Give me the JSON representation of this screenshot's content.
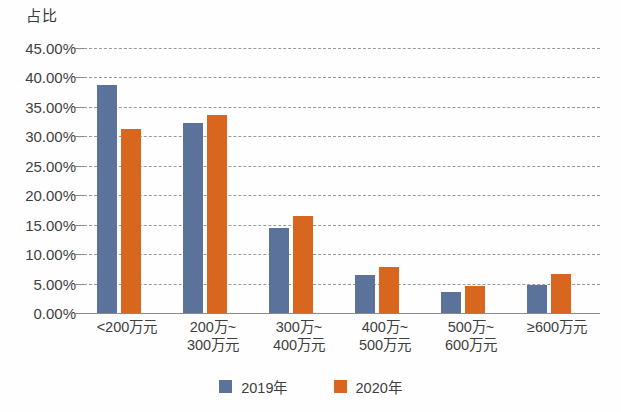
{
  "chart_data": {
    "type": "bar",
    "title": "占比",
    "xlabel": "",
    "ylabel": "占比",
    "ylim": [
      0,
      45
    ],
    "grid": true,
    "legend_position": "bottom",
    "categories": [
      "<200万元",
      "200万~\n300万元",
      "300万~\n400万元",
      "400万~\n500万元",
      "500万~\n600万元",
      "≥600万元"
    ],
    "ytick_labels": [
      "45.00%",
      "40.00%",
      "35.00%",
      "30.00%",
      "25.00%",
      "20.00%",
      "15.00%",
      "10.00%",
      "5.00%",
      "0.00%"
    ],
    "ytick_values": [
      45,
      40,
      35,
      30,
      25,
      20,
      15,
      10,
      5,
      0
    ],
    "series": [
      {
        "name": "2019年",
        "color": "#5B739B",
        "values": [
          38.7,
          32.2,
          14.4,
          6.4,
          3.5,
          4.8
        ]
      },
      {
        "name": "2020年",
        "color": "#D9661F",
        "values": [
          31.2,
          33.6,
          16.5,
          7.8,
          4.6,
          6.7
        ]
      }
    ]
  },
  "colors": {
    "series_2019": "#5B739B",
    "series_2020": "#D9661F",
    "gridline": "#9a9a9a",
    "axis": "#8a8a8a",
    "text": "#3f3f3f",
    "background": "#fefefe"
  }
}
